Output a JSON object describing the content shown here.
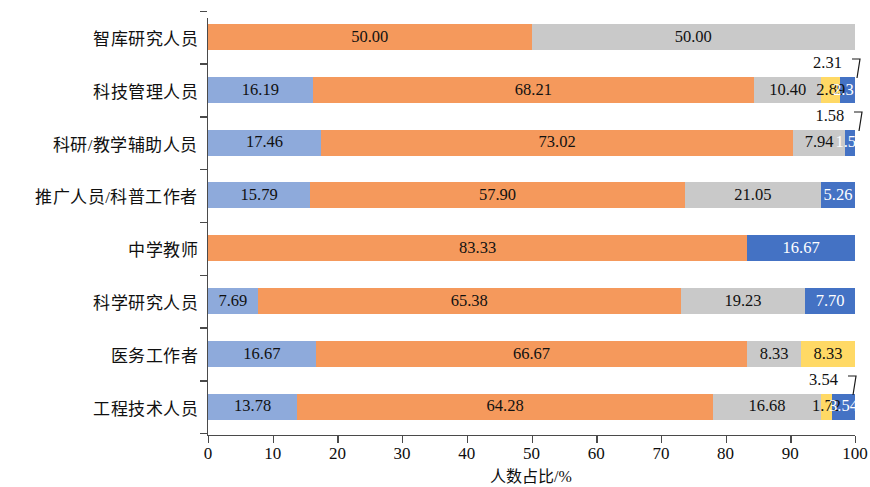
{
  "chart_data": {
    "type": "bar",
    "orientation": "horizontal",
    "stacked": true,
    "title": "",
    "xlabel": "人数占比/%",
    "ylabel": "",
    "xlim": [
      0,
      100
    ],
    "xticks": [
      "0",
      "10",
      "20",
      "30",
      "40",
      "50",
      "60",
      "70",
      "80",
      "90",
      "100"
    ],
    "grid": false,
    "legend": "none",
    "categories": [
      "智库研究人员",
      "科技管理人员",
      "科研/教学辅助人员",
      "推广人员/科普工作者",
      "中学教师",
      "科学研究人员",
      "医务工作者",
      "工程技术人员"
    ],
    "series": [
      {
        "name": "series-1",
        "color": "#8EAADB",
        "values": [
          0,
          16.19,
          17.46,
          15.79,
          0,
          7.69,
          16.67,
          13.78
        ]
      },
      {
        "name": "series-2",
        "color": "#F5995C",
        "values": [
          50.0,
          68.21,
          73.02,
          57.9,
          83.33,
          65.38,
          66.67,
          64.28
        ]
      },
      {
        "name": "series-3",
        "color": "#C9C9C9",
        "values": [
          50.0,
          10.4,
          7.94,
          21.05,
          0,
          19.23,
          8.33,
          16.68
        ]
      },
      {
        "name": "series-4",
        "color": "#FFD965",
        "values": [
          0,
          2.89,
          0,
          0,
          0,
          0,
          8.33,
          1.72
        ]
      },
      {
        "name": "series-5",
        "color": "#4472C4",
        "values": [
          0,
          2.31,
          1.58,
          5.26,
          16.67,
          7.7,
          0,
          3.54
        ]
      }
    ],
    "labels": [
      [
        "",
        "50.00",
        "50.00",
        "",
        ""
      ],
      [
        "16.19",
        "68.21",
        "10.40",
        "2.89",
        "2.31"
      ],
      [
        "17.46",
        "73.02",
        "7.94",
        "",
        "1.58"
      ],
      [
        "15.79",
        "57.90",
        "21.05",
        "",
        "5.26"
      ],
      [
        "",
        "83.33",
        "",
        "",
        "16.67"
      ],
      [
        "7.69",
        "65.38",
        "19.23",
        "",
        "7.70"
      ],
      [
        "16.67",
        "66.67",
        "8.33",
        "8.33",
        ""
      ],
      [
        "13.78",
        "64.28",
        "16.68",
        "1.72",
        "3.54"
      ]
    ],
    "callouts": [
      {
        "row": 1,
        "series": 4,
        "text": "2.31"
      },
      {
        "row": 2,
        "series": 4,
        "text": "1.58"
      },
      {
        "row": 7,
        "series": 4,
        "text": "3.54"
      }
    ]
  }
}
